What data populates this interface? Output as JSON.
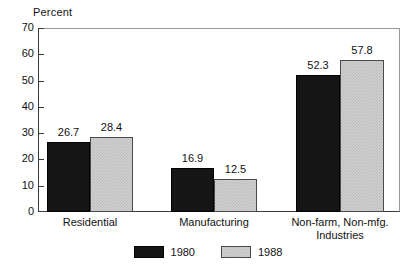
{
  "chart_data": {
    "type": "bar",
    "title": "",
    "subtitle": "",
    "xlabel": "",
    "ylabel": "Percent",
    "ylim": [
      0,
      70
    ],
    "yticks": [
      0,
      10,
      20,
      30,
      40,
      50,
      60,
      70
    ],
    "ytick_labels": [
      "0",
      "10",
      "20",
      "30",
      "40",
      "50",
      "60",
      "70"
    ],
    "grid": false,
    "legend_position": "bottom-center",
    "categories": [
      "Residential",
      "Manufacturing",
      "Non-farm, Non-mfg. Industries"
    ],
    "category_lines": [
      [
        "Residential"
      ],
      [
        "Manufacturing"
      ],
      [
        "Non-farm, Non-mfg.",
        "Industries"
      ]
    ],
    "series": [
      {
        "name": "1980",
        "values": [
          26.7,
          16.9,
          52.3
        ],
        "value_labels": [
          "26.7",
          "16.9",
          "52.3"
        ],
        "color": "#151515",
        "pattern": "solid"
      },
      {
        "name": "1988",
        "values": [
          28.4,
          12.5,
          57.8
        ],
        "value_labels": [
          "28.4",
          "12.5",
          "57.8"
        ],
        "color": "#d2d2d2",
        "pattern": "crosshatch"
      }
    ],
    "annotations": []
  },
  "legend": {
    "items": [
      {
        "label": "1980"
      },
      {
        "label": "1988"
      }
    ]
  },
  "axis": {
    "y_title": "Percent"
  }
}
